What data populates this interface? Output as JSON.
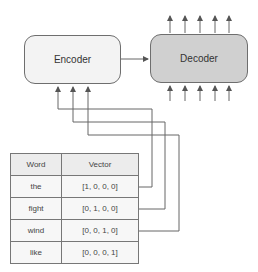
{
  "diagram": {
    "encoder": {
      "label": "Encoder",
      "fill": "#f3f3f3"
    },
    "decoder": {
      "label": "Decoder",
      "fill": "#d0d0d0"
    },
    "decoder_outputs_count": 5,
    "decoder_inputs_count": 5,
    "encoder_inputs_count": 3
  },
  "table": {
    "headers": [
      "Word",
      "Vector"
    ],
    "rows": [
      {
        "word": "the",
        "vector": "[1, 0, 0, 0]"
      },
      {
        "word": "fight",
        "vector": "[0, 1, 0, 0]"
      },
      {
        "word": "wind",
        "vector": "[0, 0, 1, 0]"
      },
      {
        "word": "like",
        "vector": "[0, 0, 0, 1]"
      }
    ]
  }
}
